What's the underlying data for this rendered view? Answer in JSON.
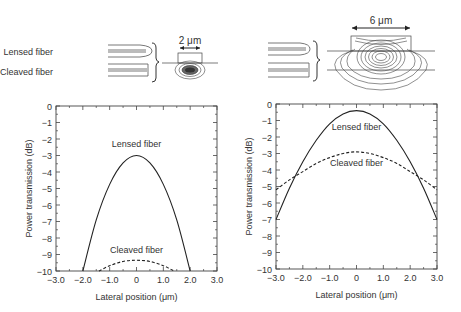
{
  "diagrams": {
    "left": {
      "labels": [
        "Lensed fiber",
        "Cleaved fiber"
      ],
      "dimension_label": "2 μm"
    },
    "right": {
      "dimension_label": "6 μm"
    }
  },
  "chart_data": [
    {
      "type": "line",
      "title": "",
      "xlabel": "Lateral position (μm)",
      "ylabel": "Power transmission (dB)",
      "xlim": [
        -3.0,
        3.0
      ],
      "ylim": [
        -10,
        0
      ],
      "xticks": [
        "−3.0",
        "−2.0",
        "−1.0",
        "0",
        "1.0",
        "2.0",
        "3.0"
      ],
      "xtick_values": [
        -3,
        -2,
        -1,
        0,
        1,
        2,
        3
      ],
      "yticks": [
        "0",
        "−1",
        "−2",
        "−3",
        "−4",
        "−5",
        "−6",
        "−7",
        "−8",
        "−9",
        "−10"
      ],
      "ytick_values": [
        0,
        -1,
        -2,
        -3,
        -4,
        -5,
        -6,
        -7,
        -8,
        -9,
        -10
      ],
      "grid": false,
      "series": [
        {
          "name": "Lensed fiber",
          "style": "solid",
          "x": [
            -2.0,
            -1.5,
            -1.0,
            -0.5,
            0,
            0.5,
            1.0,
            1.5,
            2.0
          ],
          "y": [
            -10.0,
            -6.9,
            -4.75,
            -3.45,
            -3.0,
            -3.45,
            -4.75,
            -6.9,
            -10.0
          ]
        },
        {
          "name": "Cleaved fiber",
          "style": "dashed",
          "x": [
            -1.4,
            -1.0,
            -0.5,
            0,
            0.5,
            1.0,
            1.4
          ],
          "y": [
            -10.0,
            -9.68,
            -9.42,
            -9.35,
            -9.42,
            -9.68,
            -10.0
          ]
        }
      ],
      "annotations": [
        {
          "text": "Lensed fiber",
          "x": 0,
          "y": -2.5
        },
        {
          "text": "Cleaved fiber",
          "x": 0,
          "y": -8.9
        }
      ]
    },
    {
      "type": "line",
      "title": "",
      "xlabel": "Lateral position (μm)",
      "ylabel": "Power transmission (dB)",
      "xlim": [
        -3.0,
        3.0
      ],
      "ylim": [
        -10,
        0
      ],
      "xticks": [
        "−3.0",
        "−2.0",
        "−1.0",
        "0",
        "1.0",
        "2.0",
        "3.0"
      ],
      "xtick_values": [
        -3,
        -2,
        -1,
        0,
        1,
        2,
        3
      ],
      "yticks": [
        "0",
        "−1",
        "−2",
        "−3",
        "−4",
        "−5",
        "−6",
        "−7",
        "−8",
        "−9",
        "−10"
      ],
      "ytick_values": [
        0,
        -1,
        -2,
        -3,
        -4,
        -5,
        -6,
        -7,
        -8,
        -9,
        -10
      ],
      "grid": false,
      "series": [
        {
          "name": "Lensed fiber",
          "style": "solid",
          "x": [
            -3.0,
            -2.5,
            -2.0,
            -1.5,
            -1.0,
            -0.5,
            0,
            0.5,
            1.0,
            1.5,
            2.0,
            2.5,
            3.0
          ],
          "y": [
            -7.0,
            -5.1,
            -3.5,
            -2.2,
            -1.2,
            -0.6,
            -0.4,
            -0.6,
            -1.2,
            -2.2,
            -3.5,
            -5.1,
            -7.0
          ]
        },
        {
          "name": "Cleaved fiber",
          "style": "dashed",
          "x": [
            -3.0,
            -2.5,
            -2.0,
            -1.5,
            -1.0,
            -0.5,
            0,
            0.5,
            1.0,
            1.5,
            2.0,
            2.5,
            3.0
          ],
          "y": [
            -5.2,
            -4.6,
            -4.1,
            -3.6,
            -3.25,
            -3.0,
            -2.9,
            -3.0,
            -3.25,
            -3.6,
            -4.1,
            -4.6,
            -5.2
          ]
        }
      ],
      "annotations": [
        {
          "text": "Lensed fiber",
          "x": 0,
          "y": -1.55
        },
        {
          "text": "Cleaved fiber",
          "x": 0,
          "y": -3.75
        }
      ]
    }
  ]
}
